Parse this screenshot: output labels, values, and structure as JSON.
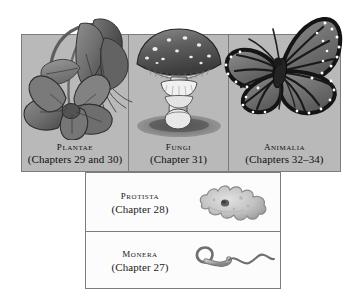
{
  "figure": {
    "background_color": "#ffffff",
    "panel_fill_top": "#b9b9b9",
    "panel_fill_bottom": "#fcfcfc",
    "border_color": "#7c7c7c",
    "text_color": "#101010"
  },
  "top_row": {
    "panels": [
      {
        "kingdom": "Plantae",
        "chapters": "(Chapters 29 and 30)",
        "illustration": "columbine-flower-illustration"
      },
      {
        "kingdom": "Fungi",
        "chapters": "(Chapter 31)",
        "illustration": "amanita-mushroom-illustration"
      },
      {
        "kingdom": "Animalia",
        "chapters": "(Chapters 32–34)",
        "illustration": "monarch-butterfly-illustration"
      }
    ]
  },
  "bottom_block": {
    "panels": [
      {
        "kingdom": "Protista",
        "chapters": "(Chapter 28)",
        "illustration": "amoeba-illustration"
      },
      {
        "kingdom": "Monera",
        "chapters": "(Chapter 27)",
        "illustration": "flagellated-bacterium-illustration"
      }
    ]
  }
}
